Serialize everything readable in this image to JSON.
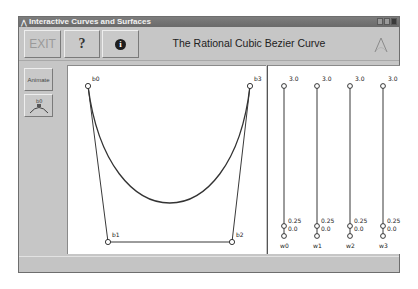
{
  "window": {
    "title": "Interactive Curves and Surfaces",
    "controls": [
      "minimize",
      "maximize",
      "close"
    ]
  },
  "toolbar": {
    "exit_label": "EXIT",
    "help_label": "?",
    "info_label": "i",
    "page_title": "The Rational Cubic Bezier Curve",
    "logo": "curve-logo-icon"
  },
  "sidebar": {
    "animate_label": "Animate",
    "curve_button_label": "b0"
  },
  "canvas": {
    "control_points": [
      {
        "label": "b0",
        "x": 20,
        "y": 20
      },
      {
        "label": "b1",
        "x": 40,
        "y": 176
      },
      {
        "label": "b2",
        "x": 164,
        "y": 176
      },
      {
        "label": "b3",
        "x": 182,
        "y": 20
      }
    ],
    "curve_color": "#333333",
    "polygon_color": "#222222"
  },
  "weights": {
    "sliders": [
      {
        "label": "w0",
        "max_label": "3.0",
        "mark_label": "0.25",
        "min_label": "0.0"
      },
      {
        "label": "w1",
        "max_label": "3.0",
        "mark_label": "0.25",
        "min_label": "0.0"
      },
      {
        "label": "w2",
        "max_label": "3.0",
        "mark_label": "0.25",
        "min_label": "0.0"
      },
      {
        "label": "w3",
        "max_label": "3.0",
        "mark_label": "0.25",
        "min_label": "0.0"
      }
    ]
  }
}
